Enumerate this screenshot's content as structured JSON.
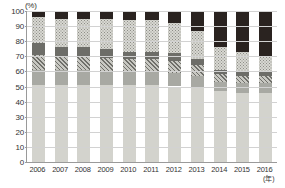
{
  "chart_data": {
    "type": "bar",
    "title": "",
    "subtitle": "",
    "xlabel": "(年)",
    "ylabel": "(%)",
    "ylim": [
      0,
      100
    ],
    "yticks": [
      0,
      10,
      20,
      30,
      40,
      50,
      60,
      70,
      80,
      90,
      100
    ],
    "ytick_labels": [
      "0",
      "10",
      "20",
      "30",
      "40",
      "50",
      "60",
      "70",
      "80",
      "90",
      "100"
    ],
    "grid": true,
    "stacked": true,
    "normalized_percent": true,
    "legend": "none",
    "categories": [
      "2006",
      "2007",
      "2008",
      "2009",
      "2010",
      "2011",
      "2012",
      "2013",
      "2014",
      "2015",
      "2016"
    ],
    "series": [
      {
        "name": "segment-1",
        "pattern": "solid-light-grey",
        "color": "#d3d3cd",
        "values": [
          51,
          51,
          51,
          51,
          51,
          51,
          50,
          49,
          47,
          46,
          46
        ]
      },
      {
        "name": "segment-2",
        "pattern": "solid-mid-grey",
        "color": "#a8a9a3",
        "values": [
          10,
          10,
          10,
          9,
          9,
          9,
          9,
          8,
          6,
          6,
          6
        ]
      },
      {
        "name": "segment-3",
        "pattern": "diagonal-hatch",
        "color": "#6f6f6a",
        "values": [
          10,
          9,
          9,
          9,
          8,
          8,
          8,
          7,
          5,
          5,
          5
        ]
      },
      {
        "name": "segment-4",
        "pattern": "solid-dark-grey",
        "color": "#6d6d68",
        "values": [
          8,
          6,
          6,
          6,
          5,
          5,
          5,
          4,
          3,
          3,
          3
        ]
      },
      {
        "name": "segment-5",
        "pattern": "dotted",
        "color": "#d8d8d2",
        "values": [
          17,
          19,
          19,
          20,
          21,
          21,
          20,
          19,
          15,
          13,
          10
        ]
      },
      {
        "name": "segment-6",
        "pattern": "solid-near-black",
        "color": "#2a2320",
        "values": [
          4,
          5,
          5,
          5,
          6,
          6,
          8,
          13,
          24,
          27,
          30
        ]
      }
    ]
  }
}
